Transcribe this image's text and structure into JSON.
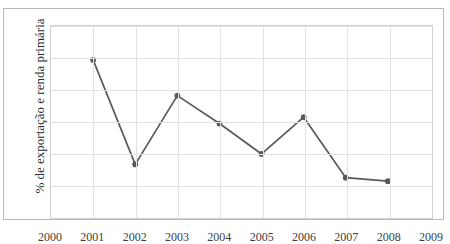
{
  "figure": {
    "top_remnant_text": "",
    "background_color": "#ffffff",
    "frame_color": "#b9b9bd"
  },
  "chart_data": {
    "type": "line",
    "title": "",
    "xlabel": "",
    "ylabel": "% de exportação e renda primária",
    "x": [
      2001,
      2002,
      2003,
      2004,
      2005,
      2006,
      2007,
      2008
    ],
    "values": [
      49.3,
      16.3,
      38.0,
      29.2,
      19.6,
      31.2,
      12.1,
      11.0
    ],
    "series": [
      {
        "name": "% de exportação e renda primária",
        "values": [
          49.3,
          16.3,
          38.0,
          29.2,
          19.6,
          31.2,
          12.1,
          11.0
        ]
      }
    ],
    "xlim": [
      2000,
      2009
    ],
    "ylim": [
      0,
      60
    ],
    "xticks": [
      "2000",
      "2001",
      "2002",
      "2003",
      "2004",
      "2005",
      "2006",
      "2007",
      "2008",
      "2009"
    ],
    "xtick_values": [
      2000,
      2001,
      2002,
      2003,
      2004,
      2005,
      2006,
      2007,
      2008,
      2009
    ],
    "yticks": [
      "0",
      "10",
      "20",
      "30",
      "40",
      "50",
      "60"
    ],
    "ytick_values": [
      0,
      10,
      20,
      30,
      40,
      50,
      60
    ],
    "grid": true,
    "grid_color": "#e2e2e6",
    "legend": false,
    "legend_position": "none",
    "line_color": "#595959",
    "marker_color": "#595959",
    "marker": "circle"
  }
}
